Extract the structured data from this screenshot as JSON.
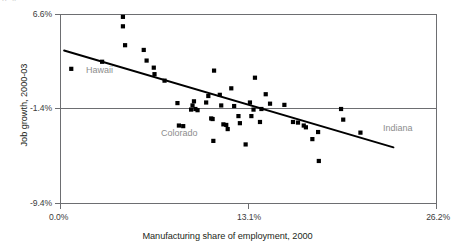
{
  "figure": {
    "top_clip_text": "p. 4",
    "background_color": "#ffffff",
    "marker_color": "#000000",
    "trendline_color": "#000000",
    "annotation_color": "#8d8d8d",
    "axis_color": "#6d6e71"
  },
  "chart_data": {
    "type": "scatter",
    "title": "",
    "xlabel": "Manufacturing share of employment, 2000",
    "ylabel": "Job growth, 2000-03",
    "xlim": [
      0.0,
      26.2
    ],
    "ylim": [
      -9.4,
      6.6
    ],
    "xticks": [
      0.0,
      13.1,
      26.2
    ],
    "xticklabels": [
      "0.0%",
      "13.1%",
      "26.2%"
    ],
    "yticks": [
      -9.4,
      -1.4,
      6.6
    ],
    "yticklabels": [
      "-9.4%",
      "-1.4%",
      "6.6%"
    ],
    "grid": false,
    "zero_reference_line_y": -1.4,
    "legend": "none",
    "series": [
      {
        "name": "States",
        "marker": "square",
        "points": [
          {
            "x": 0.75,
            "y": 2.0,
            "label": "Hawaii"
          },
          {
            "x": 2.9,
            "y": 2.6
          },
          {
            "x": 4.35,
            "y": 6.4
          },
          {
            "x": 4.35,
            "y": 5.6
          },
          {
            "x": 4.5,
            "y": 4.0
          },
          {
            "x": 5.8,
            "y": 3.6
          },
          {
            "x": 6.0,
            "y": 2.7
          },
          {
            "x": 6.5,
            "y": 2.1
          },
          {
            "x": 7.25,
            "y": 1.0
          },
          {
            "x": 6.55,
            "y": 1.55
          },
          {
            "x": 8.15,
            "y": -0.9
          },
          {
            "x": 8.25,
            "y": -2.8
          },
          {
            "x": 8.55,
            "y": -2.85
          },
          {
            "x": 9.1,
            "y": -1.45
          },
          {
            "x": 9.2,
            "y": -1.1
          },
          {
            "x": 9.3,
            "y": -0.75
          },
          {
            "x": 9.55,
            "y": -1.5
          },
          {
            "x": 10.15,
            "y": -0.85
          },
          {
            "x": 10.3,
            "y": -0.3
          },
          {
            "x": 10.5,
            "y": -2.2
          },
          {
            "x": 10.6,
            "y": -2.25
          },
          {
            "x": 10.65,
            "y": -4.1
          },
          {
            "x": 10.7,
            "y": 1.85
          },
          {
            "x": 11.1,
            "y": -0.2
          },
          {
            "x": 11.2,
            "y": -1.1
          },
          {
            "x": 11.35,
            "y": -2.7
          },
          {
            "x": 11.55,
            "y": -2.75
          },
          {
            "x": 11.65,
            "y": -3.1
          },
          {
            "x": 11.9,
            "y": 0.35
          },
          {
            "x": 12.4,
            "y": -2.0
          },
          {
            "x": 12.5,
            "y": -2.6
          },
          {
            "x": 12.9,
            "y": -4.4
          },
          {
            "x": 13.2,
            "y": -0.85
          },
          {
            "x": 13.3,
            "y": -2.0
          },
          {
            "x": 13.45,
            "y": -1.45
          },
          {
            "x": 13.55,
            "y": 1.25
          },
          {
            "x": 13.9,
            "y": -2.5
          },
          {
            "x": 14.3,
            "y": -0.15
          },
          {
            "x": 14.6,
            "y": -0.95
          },
          {
            "x": 15.6,
            "y": -1.05
          },
          {
            "x": 16.2,
            "y": -2.5
          },
          {
            "x": 16.55,
            "y": -2.55
          },
          {
            "x": 16.95,
            "y": -2.8
          },
          {
            "x": 17.1,
            "y": -2.95
          },
          {
            "x": 17.55,
            "y": -3.95
          },
          {
            "x": 17.95,
            "y": -3.35
          },
          {
            "x": 18.0,
            "y": -5.8
          },
          {
            "x": 19.55,
            "y": -1.4
          },
          {
            "x": 19.7,
            "y": -2.3
          },
          {
            "x": 20.9,
            "y": -3.4,
            "label": "Indiana"
          },
          {
            "x": 9.4,
            "y": -1.4
          },
          {
            "x": 12.1,
            "y": -1.15
          },
          {
            "x": 14.0,
            "y": -1.4
          }
        ]
      }
    ],
    "trendline": {
      "type": "linear-fit",
      "x_start": 0.25,
      "y_start": 3.55,
      "x_end": 23.2,
      "y_end": -4.65
    },
    "annotations": [
      {
        "text": "Hawaii",
        "x": 2.3,
        "y": 0.85
      },
      {
        "text": "Colorado",
        "x": 8.3,
        "y": -4.1
      },
      {
        "text": "Indiana",
        "x": 21.6,
        "y": -3.3
      }
    ]
  }
}
